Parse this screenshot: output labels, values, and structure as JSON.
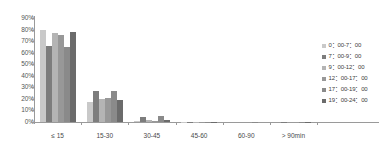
{
  "chart_data": {
    "type": "bar",
    "title": "",
    "xlabel": "",
    "ylabel": "",
    "ylim": [
      0,
      90
    ],
    "ytick_labels": [
      "90%",
      "80%",
      "70%",
      "60%",
      "50%",
      "40%",
      "30%",
      "20%",
      "10%",
      "0%"
    ],
    "ytick_values": [
      90,
      80,
      70,
      60,
      50,
      40,
      30,
      20,
      10,
      0
    ],
    "grid": false,
    "legend_position": "right",
    "categories": [
      "≤ 15",
      "15-30",
      "30-45",
      "45-60",
      "60-90",
      "> 90min"
    ],
    "series": [
      {
        "name": "0：00-7：00",
        "color": "#c9c9c9",
        "values": [
          80,
          17,
          1.0,
          0.2,
          0.0,
          0.0
        ]
      },
      {
        "name": "7：00-9：00",
        "color": "#7d7d7d",
        "values": [
          66,
          27,
          4.0,
          0.3,
          0.0,
          0.2
        ]
      },
      {
        "name": "9：00-12：00",
        "color": "#b4b4b4",
        "values": [
          77,
          20,
          1.5,
          0.3,
          0.0,
          0.0
        ]
      },
      {
        "name": "12：00-17：00",
        "color": "#989898",
        "values": [
          75,
          21,
          1.2,
          0.3,
          0.0,
          0.0
        ]
      },
      {
        "name": "17：00-19：00",
        "color": "#8a8a8a",
        "values": [
          65,
          27,
          5.0,
          0.4,
          0.3,
          0.3
        ]
      },
      {
        "name": "19：00-24：00",
        "color": "#6b6b6b",
        "values": [
          78,
          19,
          2.0,
          0.3,
          0.0,
          0.2
        ]
      }
    ]
  }
}
